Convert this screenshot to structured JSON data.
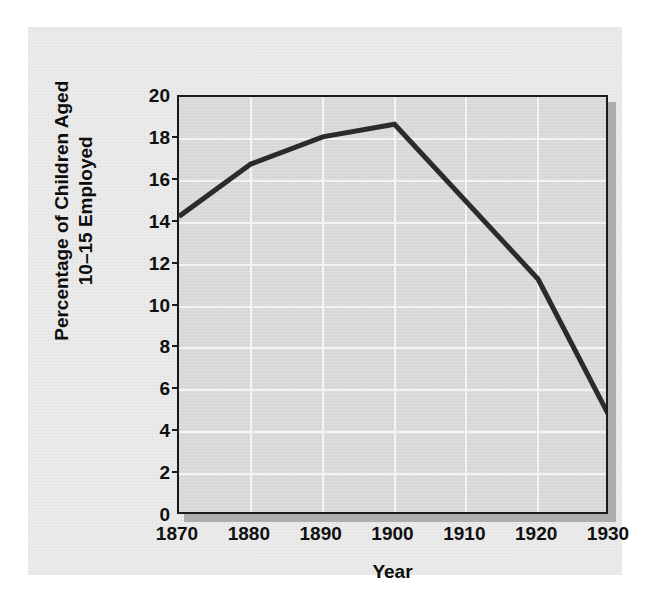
{
  "chart_data": {
    "type": "line",
    "title": "",
    "xlabel": "Year",
    "ylabel": "Percentage of Children Aged 10–15 Employed",
    "ylabel_line1": "Percentage of Children Aged",
    "ylabel_line2": "10–15 Employed",
    "x": [
      1870,
      1880,
      1890,
      1900,
      1920,
      1930
    ],
    "values": [
      14.3,
      16.8,
      18.1,
      18.7,
      11.3,
      4.7
    ],
    "series": [
      {
        "name": "Percentage of Children Aged 10-15 Employed",
        "values": [
          14.3,
          16.8,
          18.1,
          18.7,
          11.3,
          4.7
        ]
      }
    ],
    "xlim": [
      1870,
      1930
    ],
    "ylim": [
      0,
      20
    ],
    "xticks": [
      1870,
      1880,
      1890,
      1900,
      1910,
      1920,
      1930
    ],
    "xtick_labels": [
      "1870",
      "1880",
      "1890",
      "1900",
      "1910",
      "1920",
      "1930"
    ],
    "yticks": [
      0,
      2,
      4,
      6,
      8,
      10,
      12,
      14,
      16,
      18,
      20
    ],
    "ytick_labels": [
      "0",
      "2",
      "4",
      "6",
      "8",
      "10",
      "12",
      "14",
      "16",
      "18",
      "20"
    ],
    "grid": true,
    "legend": "none",
    "colors": {
      "figure_background": "#ebebeb",
      "plot_background": "#d9d9d9",
      "gridline": "#f4f4f4",
      "axis_frame": "#1b1b1b",
      "series_line": "#2b2b2b",
      "drop_shadow": "#aeaeae",
      "tick_text": "#101010"
    }
  }
}
